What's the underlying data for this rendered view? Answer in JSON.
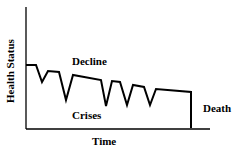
{
  "chart_data": {
    "type": "line",
    "title": "",
    "xlabel": "Time",
    "ylabel": "Health Status",
    "annotations": [
      "Decline",
      "Crises",
      "Death"
    ],
    "grid": false,
    "legend": "none",
    "series": [
      {
        "name": "Health Status trajectory",
        "points": [
          [
            26,
            65
          ],
          [
            36,
            65
          ],
          [
            42,
            82
          ],
          [
            48,
            71
          ],
          [
            59,
            72
          ],
          [
            66,
            100
          ],
          [
            73,
            75
          ],
          [
            101,
            80
          ],
          [
            106,
            106
          ],
          [
            112,
            81
          ],
          [
            120,
            82
          ],
          [
            127,
            105
          ],
          [
            133,
            85
          ],
          [
            144,
            87
          ],
          [
            150,
            105
          ],
          [
            156,
            89
          ],
          [
            191,
            92
          ],
          [
            191,
            128
          ]
        ]
      }
    ]
  },
  "labels": {
    "ylabel": "Health Status",
    "xlabel": "Time",
    "decline": "Decline",
    "crises": "Crises",
    "death": "Death"
  }
}
